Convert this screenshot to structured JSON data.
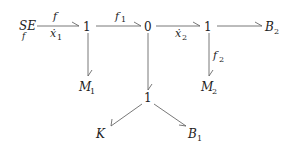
{
  "diagram": {
    "type": "bond-graph",
    "nodes": [
      {
        "id": "SEf",
        "label": "SE",
        "sub": "f",
        "x": 27,
        "y": 27
      },
      {
        "id": "j1a",
        "label": "1",
        "x": 87,
        "y": 27
      },
      {
        "id": "j0",
        "label": "0",
        "x": 148,
        "y": 27
      },
      {
        "id": "j1b",
        "label": "1",
        "x": 208,
        "y": 27
      },
      {
        "id": "B2",
        "label": "B",
        "sub": "2",
        "x": 272,
        "y": 27
      },
      {
        "id": "M1",
        "label": "M",
        "sub": "1",
        "x": 89,
        "y": 88
      },
      {
        "id": "j1c",
        "label": "1",
        "x": 148,
        "y": 99
      },
      {
        "id": "M2",
        "label": "M",
        "sub": "2",
        "x": 210,
        "y": 88
      },
      {
        "id": "K",
        "label": "K",
        "x": 102,
        "y": 135
      },
      {
        "id": "B1",
        "label": "B",
        "sub": "1",
        "x": 195,
        "y": 135
      }
    ],
    "edges": [
      {
        "from": "SEf",
        "to": "j1a",
        "label_above": "f",
        "label_below": "ẋ",
        "label_below_sub": "1"
      },
      {
        "from": "j1a",
        "to": "j0",
        "label_above": "f",
        "label_above_sub": "1"
      },
      {
        "from": "j0",
        "to": "j1b",
        "label_below": "ẋ",
        "label_below_sub": "2"
      },
      {
        "from": "j1b",
        "to": "B2"
      },
      {
        "from": "j1a",
        "to": "M1"
      },
      {
        "from": "j0",
        "to": "j1c"
      },
      {
        "from": "j1b",
        "to": "M2",
        "label_right": "f",
        "label_right_sub": "2"
      },
      {
        "from": "j1c",
        "to": "K"
      },
      {
        "from": "j1c",
        "to": "B1"
      }
    ]
  },
  "labels": {
    "se": "SE",
    "se_sub": "f",
    "one": "1",
    "zero": "0",
    "f": "f",
    "f1": "f",
    "f1_sub": "1",
    "f2": "f",
    "f2_sub": "2",
    "x1": "ẋ",
    "x1_sub": "1",
    "x2": "ẋ",
    "x2_sub": "2",
    "b2": "B",
    "b2_sub": "2",
    "b1": "B",
    "b1_sub": "1",
    "m1": "M",
    "m1_sub": "1",
    "m2": "M",
    "m2_sub": "2",
    "k": "K"
  }
}
